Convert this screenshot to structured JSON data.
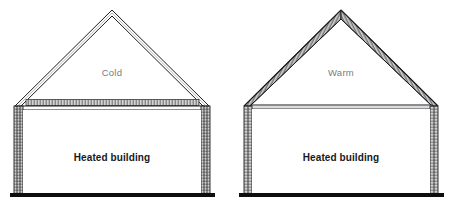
{
  "figure": {
    "background_color": "#ffffff",
    "line_color": "#1b1c1e",
    "insulation_fill": "#b9b9b9",
    "wall_fill": "#9a9a9a",
    "label_gray": "#7b7b7b",
    "label_black": "#17181a"
  },
  "houses": [
    {
      "id": "left-house",
      "attic_label": "Cold",
      "room_label": "Heated building",
      "insulation_location": "ceiling",
      "apex_x": 112,
      "apex_y": 10,
      "eave_y": 104,
      "left_wall_x": 18,
      "right_wall_x": 207,
      "ground_y": 195
    },
    {
      "id": "right-house",
      "attic_label": "Warm",
      "room_label": "Heated building",
      "insulation_location": "rafters",
      "apex_x": 341,
      "apex_y": 10,
      "eave_y": 104,
      "left_wall_x": 247,
      "right_wall_x": 436,
      "ground_y": 195
    }
  ]
}
